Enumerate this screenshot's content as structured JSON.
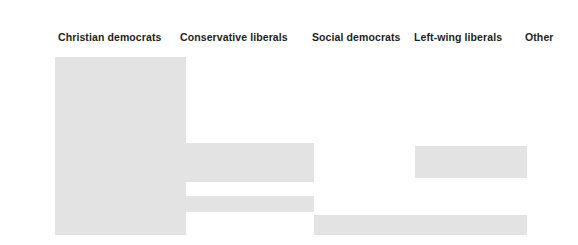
{
  "chart_data": {
    "type": "bar",
    "title": "",
    "subtitle": "",
    "xlabel": "",
    "ylabel": "",
    "grid": false,
    "legend_position": "top",
    "categories": [
      "Christian democrats",
      "Conservative liberals",
      "Social democrats",
      "Left-wing liberals",
      "Other"
    ],
    "series": [
      {
        "name": "Block area",
        "values": [
          180,
          39,
          20,
          32,
          20
        ]
      }
    ],
    "blocks": [
      {
        "category": "Christian democrats",
        "x": 55,
        "y": 57,
        "width": 131,
        "height": 178,
        "color": "#e3e3e3"
      },
      {
        "category": "Conservative liberals",
        "x": 186,
        "y": 143,
        "width": 128,
        "height": 39,
        "color": "#e3e3e3"
      },
      {
        "category": "Conservative liberals",
        "x": 186,
        "y": 196,
        "width": 128,
        "height": 16,
        "color": "#e3e3e3"
      },
      {
        "category": "Social democrats",
        "x": 314,
        "y": 215,
        "width": 213,
        "height": 20,
        "color": "#e3e3e3"
      },
      {
        "category": "Left-wing liberals",
        "x": 415,
        "y": 146,
        "width": 112,
        "height": 32,
        "color": "#e3e3e3"
      }
    ]
  },
  "labels": [
    {
      "text": "Christian democrats",
      "x": 58,
      "y": 31
    },
    {
      "text": "Conservative liberals",
      "x": 180,
      "y": 31
    },
    {
      "text": "Social democrats",
      "x": 312,
      "y": 31
    },
    {
      "text": "Left-wing liberals",
      "x": 414,
      "y": 31
    },
    {
      "text": "Other",
      "x": 525,
      "y": 31
    }
  ],
  "colors": {
    "background": "#ffffff",
    "block_fill": "#e3e3e3",
    "label_text": "#231f20"
  }
}
